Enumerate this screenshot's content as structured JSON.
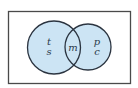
{
  "diagram": {
    "type": "venn",
    "universe": {
      "label": ""
    },
    "sets": [
      {
        "name": "left-set",
        "region_labels": [
          "t",
          "s"
        ]
      },
      {
        "name": "right-set",
        "region_labels": [
          "p",
          "c"
        ]
      }
    ],
    "intersection": {
      "label": "m"
    },
    "colors": {
      "fill": "#cce4f4",
      "stroke": "#2b3440",
      "frame": "#4a4a4a"
    }
  }
}
